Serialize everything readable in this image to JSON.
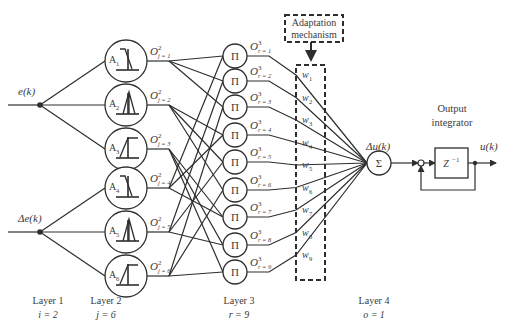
{
  "inputs": [
    {
      "label": "e(k)",
      "symbol": "e",
      "arg": "(k)"
    },
    {
      "label": "Δe(k)",
      "symbol": "Δe",
      "arg": "(k)"
    }
  ],
  "layer2": {
    "nodes": [
      {
        "label": "A",
        "sub": "1",
        "out": "O",
        "out_sup": "2",
        "out_sub": "j = 1",
        "shape": "z-shape"
      },
      {
        "label": "A",
        "sub": "2",
        "out": "O",
        "out_sup": "2",
        "out_sub": "j = 2",
        "shape": "triangle"
      },
      {
        "label": "A",
        "sub": "3",
        "out": "O",
        "out_sup": "2",
        "out_sub": "j = 3",
        "shape": "s-shape"
      },
      {
        "label": "A",
        "sub": "4",
        "out": "O",
        "out_sup": "2",
        "out_sub": "j = 4",
        "shape": "z-shape"
      },
      {
        "label": "A",
        "sub": "5",
        "out": "O",
        "out_sup": "2",
        "out_sub": "j = 5",
        "shape": "triangle"
      },
      {
        "label": "A",
        "sub": "6",
        "out": "O",
        "out_sup": "2",
        "out_sub": "j = 6",
        "shape": "s-shape"
      }
    ]
  },
  "layer3": {
    "symbol": "Π",
    "nodes": [
      {
        "out": "O",
        "out_sup": "3",
        "out_sub": "r = 1"
      },
      {
        "out": "O",
        "out_sup": "3",
        "out_sub": "r = 2"
      },
      {
        "out": "O",
        "out_sup": "3",
        "out_sub": "r = 3"
      },
      {
        "out": "O",
        "out_sup": "3",
        "out_sub": "r = 4"
      },
      {
        "out": "O",
        "out_sup": "3",
        "out_sub": "r = 5"
      },
      {
        "out": "O",
        "out_sup": "3",
        "out_sub": "r = 6"
      },
      {
        "out": "O",
        "out_sup": "3",
        "out_sub": "r = 7"
      },
      {
        "out": "O",
        "out_sup": "3",
        "out_sub": "r = 8"
      },
      {
        "out": "O",
        "out_sup": "3",
        "out_sub": "r = 9"
      }
    ]
  },
  "weights": [
    {
      "w": "w",
      "sub": "1"
    },
    {
      "w": "w",
      "sub": "2"
    },
    {
      "w": "w",
      "sub": "3"
    },
    {
      "w": "w",
      "sub": "4"
    },
    {
      "w": "w",
      "sub": "5"
    },
    {
      "w": "w",
      "sub": "6"
    },
    {
      "w": "w",
      "sub": "7"
    },
    {
      "w": "w",
      "sub": "8"
    },
    {
      "w": "w",
      "sub": "9"
    }
  ],
  "adaptation": {
    "line1": "Adaptation",
    "line2": "mechanism"
  },
  "sum_node": {
    "symbol": "Σ",
    "out_label": "Δu(k)"
  },
  "integrator": {
    "title_line1": "Output",
    "title_line2": "integrator",
    "delay": "Z",
    "delay_sup": "−1",
    "output_label": "u(k)"
  },
  "layer_labels": [
    {
      "name": "Layer 1",
      "count": "i = 2"
    },
    {
      "name": "Layer 2",
      "count": "j = 6"
    },
    {
      "name": "Layer 3",
      "count": "r = 9"
    },
    {
      "name": "Layer 4",
      "count": "o = 1"
    }
  ],
  "colors": {
    "stroke": "#2e2e2e",
    "text": "#3a3a3a",
    "background": "#ffffff"
  }
}
